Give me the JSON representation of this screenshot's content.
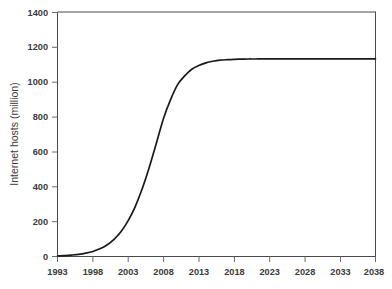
{
  "chart_data": {
    "type": "line",
    "title": "",
    "subtitle": "",
    "xlabel": "",
    "ylabel": "Internet hosts (million)",
    "xlim": [
      1993,
      2038
    ],
    "ylim": [
      0,
      1400
    ],
    "grid": false,
    "legend": false,
    "legend_position": "none",
    "line_color": "#1a1a1a",
    "axis_color": "#4a4a4a",
    "text_color": "#3b3b3b",
    "background_color": "#ffffff",
    "xticks": [
      1993,
      1998,
      2003,
      2008,
      2013,
      2018,
      2023,
      2028,
      2033,
      2038
    ],
    "xtick_labels": [
      "1993",
      "1998",
      "2003",
      "2008",
      "2013",
      "2018",
      "2023",
      "2028",
      "2033",
      "2038"
    ],
    "yticks": [
      0,
      200,
      400,
      600,
      800,
      1000,
      1200,
      1400
    ],
    "ytick_labels": [
      "0",
      "200",
      "400",
      "600",
      "800",
      "1000",
      "1200",
      "1400"
    ],
    "series": [
      {
        "name": "Internet hosts",
        "x": [
          1993,
          1994,
          1995,
          1996,
          1997,
          1998,
          1999,
          2000,
          2001,
          2002,
          2003,
          2004,
          2005,
          2006,
          2007,
          2008,
          2009,
          2010,
          2011,
          2012,
          2013,
          2014,
          2015,
          2016,
          2017,
          2018,
          2019,
          2020,
          2021,
          2022,
          2023,
          2024,
          2025,
          2026,
          2027,
          2028,
          2029,
          2030,
          2031,
          2032,
          2033,
          2034,
          2035,
          2036,
          2037,
          2038
        ],
        "values": [
          3,
          5,
          8,
          12,
          19,
          29,
          44,
          66,
          98,
          143,
          205,
          286,
          389,
          512,
          650,
          790,
          898,
          984,
          1034,
          1072,
          1094,
          1109,
          1118,
          1124,
          1127,
          1129,
          1130,
          1131,
          1131,
          1132,
          1132,
          1132,
          1132,
          1132,
          1132,
          1132,
          1132,
          1132,
          1132,
          1132,
          1132,
          1132,
          1132,
          1132,
          1132,
          1132
        ]
      }
    ],
    "annotations": []
  },
  "axis": {
    "y_title": "Internet hosts (million)"
  }
}
